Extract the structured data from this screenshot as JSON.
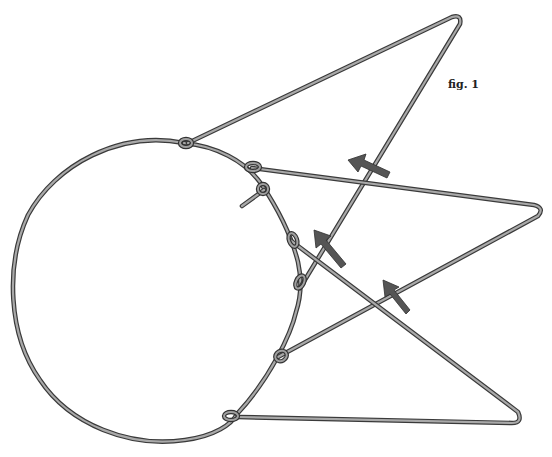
{
  "figure": {
    "label": "fig. 1",
    "label_position": {
      "x": 448,
      "y": 81
    },
    "colors": {
      "background": "#ffffff",
      "wire_outline": "#3a3a3a",
      "wire_fill": "#a9a9a9",
      "arrow_fill": "#555555"
    }
  },
  "ring": {
    "cx": 150,
    "cy": 289,
    "rx": 138,
    "ry": 152
  },
  "apexes": [
    {
      "name": "top",
      "x": 458,
      "y": 19
    },
    {
      "name": "right",
      "x": 541,
      "y": 208
    },
    {
      "name": "bottom",
      "x": 520,
      "y": 421
    }
  ],
  "arrows": [
    {
      "name": "arrow-1",
      "x": 365,
      "y": 166,
      "angle": -160
    },
    {
      "name": "arrow-2",
      "x": 327,
      "y": 246,
      "angle": -135
    },
    {
      "name": "arrow-3",
      "x": 398,
      "y": 300,
      "angle": -125
    }
  ]
}
